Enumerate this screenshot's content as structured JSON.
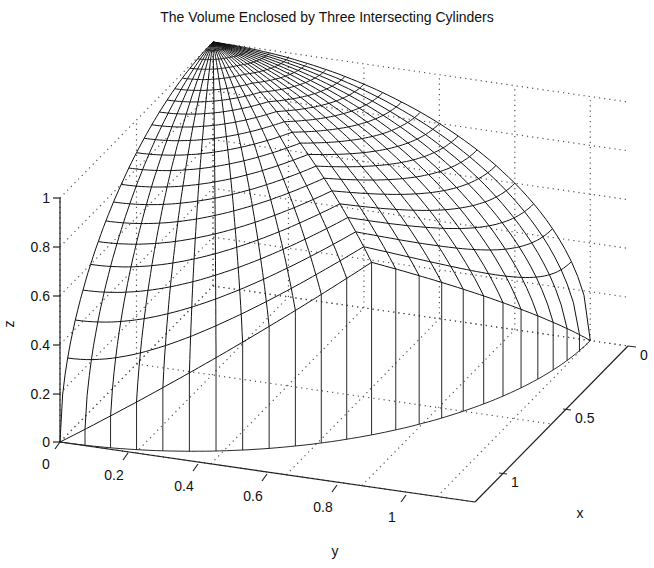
{
  "chart_data": {
    "type": "surface-mesh-3d",
    "title": "The Volume Enclosed by Three Intersecting Cylinders",
    "xlabel": "x",
    "ylabel": "y",
    "zlabel": "z",
    "x_ticks": [
      "0",
      "0.5",
      "1"
    ],
    "y_ticks": [
      "0",
      "0.2",
      "0.4",
      "0.6",
      "0.8",
      "1"
    ],
    "z_ticks": [
      "0",
      "0.2",
      "0.4",
      "0.6",
      "0.8",
      "1"
    ],
    "xlim": [
      0,
      1
    ],
    "ylim": [
      0,
      1.1
    ],
    "zlim": [
      0,
      1
    ],
    "grid": true,
    "surface_peak": {
      "x": 0.7,
      "y": 0.7,
      "z": 0.71
    },
    "surface_apex": {
      "x": 0,
      "y": 0,
      "z": 1
    }
  },
  "axes": {
    "z_ticks": [
      {
        "label": "1",
        "y": 198
      },
      {
        "label": "0.8",
        "y": 247
      },
      {
        "label": "0.6",
        "y": 296
      },
      {
        "label": "0.4",
        "y": 345
      },
      {
        "label": "0.2",
        "y": 394
      },
      {
        "label": "0",
        "y": 442
      }
    ],
    "y_ticks": [
      {
        "label": "0",
        "x": 60,
        "y": 442
      },
      {
        "label": "0.2",
        "x": 128,
        "y": 453
      },
      {
        "label": "0.4",
        "x": 198,
        "y": 464
      },
      {
        "label": "0.6",
        "x": 267,
        "y": 474
      },
      {
        "label": "0.8",
        "x": 337,
        "y": 485
      },
      {
        "label": "1",
        "x": 406,
        "y": 495
      }
    ],
    "x_ticks": [
      {
        "label": "0",
        "x": 628,
        "y": 346
      },
      {
        "label": "0.5",
        "x": 563,
        "y": 409
      },
      {
        "label": "1",
        "x": 499,
        "y": 473
      }
    ]
  }
}
